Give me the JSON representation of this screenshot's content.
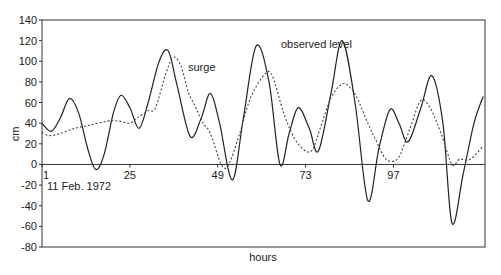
{
  "chart_data": {
    "type": "line",
    "title": "",
    "xlabel": "hours",
    "ylabel": "cm",
    "xlim": [
      1,
      122
    ],
    "ylim": [
      -80,
      140
    ],
    "yticks": [
      -80,
      -60,
      -40,
      -20,
      0,
      20,
      40,
      60,
      80,
      100,
      120,
      140
    ],
    "xticks": [
      1,
      25,
      49,
      73,
      97
    ],
    "grid": false,
    "legend": "none (inline annotations)",
    "annotations": [
      {
        "text": "observed level",
        "x": 69,
        "y": 115,
        "series": "observed level"
      },
      {
        "text": "surge",
        "x": 41,
        "y": 94,
        "series": "surge"
      },
      {
        "text": "11 Feb. 1972",
        "x": 2,
        "y": -22,
        "series": null
      }
    ],
    "series": [
      {
        "name": "observed level",
        "style": "solid",
        "x": [
          1,
          3.5,
          6,
          8.5,
          11,
          13.5,
          15.7,
          18,
          20.5,
          22.6,
          25,
          27.5,
          30,
          33,
          35.5,
          38,
          41.5,
          44.5,
          47,
          49.5,
          53,
          56,
          59.5,
          63,
          66,
          68.5,
          71,
          74,
          76.5,
          80,
          83,
          86.5,
          90,
          93,
          96,
          98.5,
          101,
          104.5,
          107.5,
          110.5,
          113,
          116,
          119,
          121.5
        ],
        "values": [
          40,
          32,
          45,
          64,
          50,
          15,
          -5,
          10,
          50,
          67,
          55,
          35,
          60,
          100,
          110,
          75,
          27,
          45,
          69,
          40,
          -15,
          45,
          115,
          80,
          0,
          30,
          55,
          35,
          13,
          70,
          120,
          60,
          -35,
          15,
          53,
          40,
          22,
          55,
          86,
          40,
          -57,
          -10,
          40,
          66
        ]
      },
      {
        "name": "surge",
        "style": "dashed",
        "x": [
          1,
          3,
          6,
          10,
          14,
          19,
          22,
          25,
          27,
          30,
          32,
          35,
          37,
          39,
          41,
          43,
          45,
          47,
          50,
          52,
          55,
          58,
          62,
          64,
          67,
          70,
          73,
          75,
          77,
          80,
          83,
          85,
          87,
          90,
          92,
          95,
          98,
          100,
          102,
          104.5,
          107,
          110,
          113,
          115,
          118,
          121.5
        ],
        "values": [
          31,
          28,
          30,
          35,
          38,
          42,
          42,
          40,
          45,
          52,
          55,
          90,
          104,
          95,
          70,
          55,
          40,
          30,
          0,
          0,
          30,
          65,
          88,
          85,
          50,
          25,
          13,
          15,
          35,
          65,
          78,
          75,
          65,
          40,
          25,
          5,
          5,
          20,
          40,
          62,
          55,
          30,
          0,
          5,
          5,
          18
        ]
      }
    ]
  }
}
